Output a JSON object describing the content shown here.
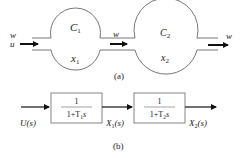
{
  "diagram_a": {
    "caption": "(a)",
    "inlet_labels": [
      "w",
      "u"
    ],
    "middle_flow_label": "w",
    "outlet_label": "w",
    "tanks": [
      {
        "name": "C",
        "name_sub": "1",
        "state": "x",
        "state_sub": "1"
      },
      {
        "name": "C",
        "name_sub": "2",
        "state": "x",
        "state_sub": "2"
      }
    ]
  },
  "diagram_b": {
    "caption": "(b)",
    "input_label": "U(s)",
    "blocks": [
      {
        "numerator": "1",
        "denominator_prefix": "1+T",
        "denominator_sub": "1",
        "denominator_suffix": "s"
      },
      {
        "numerator": "1",
        "denominator_prefix": "1+T",
        "denominator_sub": "2",
        "denominator_suffix": "s"
      }
    ],
    "signals": [
      {
        "base": "X",
        "sub": "1",
        "suffix": "(s)"
      },
      {
        "base": "X",
        "sub": "2",
        "suffix": "(s)"
      }
    ]
  },
  "colors": {
    "stroke": "#555555",
    "arrow": "#111111",
    "text": "#222222"
  }
}
